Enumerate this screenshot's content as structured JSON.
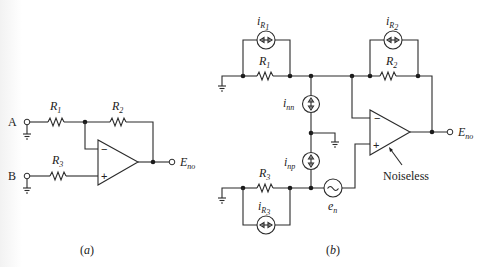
{
  "figure_a": {
    "caption": "(a)",
    "terminal_a": "A",
    "terminal_b": "B",
    "r1": {
      "name": "R",
      "sub": "1"
    },
    "r2": {
      "name": "R",
      "sub": "2"
    },
    "r3": {
      "name": "R",
      "sub": "3"
    },
    "opamp_minus": "−",
    "opamp_plus": "+",
    "output": {
      "name": "E",
      "sub": "no"
    }
  },
  "figure_b": {
    "caption": "(b)",
    "r1": {
      "name": "R",
      "sub": "1"
    },
    "r2": {
      "name": "R",
      "sub": "2"
    },
    "r3": {
      "name": "R",
      "sub": "3"
    },
    "i_r1": {
      "name": "i",
      "sub": "R",
      "subsub": "1"
    },
    "i_r2": {
      "name": "i",
      "sub": "R",
      "subsub": "2"
    },
    "i_r3": {
      "name": "i",
      "sub": "R",
      "subsub": "3"
    },
    "i_nn": {
      "name": "i",
      "sub": "nn"
    },
    "i_np": {
      "name": "i",
      "sub": "np"
    },
    "e_n": {
      "name": "e",
      "sub": "n"
    },
    "opamp_minus": "−",
    "opamp_plus": "+",
    "output": {
      "name": "E",
      "sub": "no"
    },
    "opamp_note": "Noiseless",
    "voltage_source_glyph": "~"
  }
}
